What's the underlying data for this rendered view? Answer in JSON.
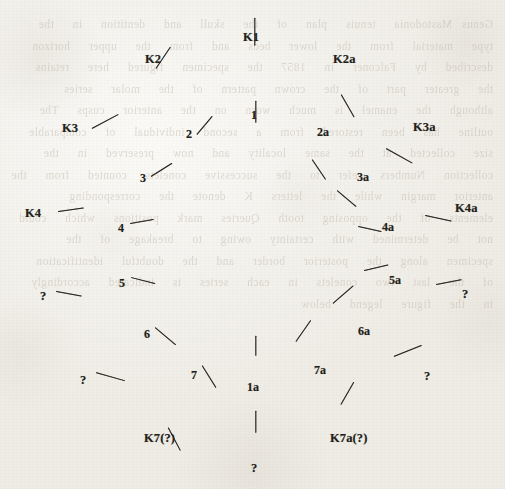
{
  "figure": {
    "kind": "scanned-diagram",
    "ink_color": "#2b2621",
    "paper_color": "#f3f1ec",
    "bleed_text": "Genus Mastodonia  tenuis  plan  of  the  skull  and  dentition  in  the  type  material  from  the  lower  beds  and  from  the  upper  horizon  described  by  Falconer  in  1857  the  specimen  figured  here  retains  the  greater  part  of  the  crown  pattern  of  the  molar  series  although  the  enamel  is  much  worn  on  the  anterior  cusps  The  outline  has  been  restored  from  a  second  individual  of  comparable  size  collected  at  the  same  locality  and  now  preserved  in  the  collection  Numbers  refer  to  the  successive  conelets  counted  from  the  anterior  margin  while  the  letters  K  denote  the  corresponding  elements  of  the  opposing  tooth  Queries  mark  positions  which  could  not  be  determined  with  certainty  owing  to  breakage  of  the  specimen  along  the  posterior  border  and  the  doubtful  identification  of  the  last  two  conelets  in  each  series  is  indicated  accordingly  in  the  figure  legend  below",
    "markers": [
      {
        "id": "K1",
        "label": "K1",
        "type": "outer",
        "lx": 243,
        "ly": 31,
        "tx": 255,
        "ty": 45,
        "len": 28,
        "angle": 90
      },
      {
        "id": "K2",
        "label": "K2",
        "type": "outer",
        "lx": 145,
        "ly": 53,
        "tx": 156,
        "ty": 68,
        "len": 26,
        "angle": 56
      },
      {
        "id": "K2a",
        "label": "K2a",
        "type": "outer",
        "lx": 333,
        "ly": 53,
        "tx": 341,
        "ty": 94,
        "len": 26,
        "angle": -60
      },
      {
        "id": "K3",
        "label": "K3",
        "type": "outer",
        "lx": 62,
        "ly": 122,
        "tx": 92,
        "ly_pad": 0,
        "ty": 128,
        "len": 30,
        "angle": 28
      },
      {
        "id": "K3a",
        "label": "K3a",
        "type": "outer",
        "lx": 413,
        "ly": 121,
        "tx": 386,
        "ty": 148,
        "len": 30,
        "angle": -29
      },
      {
        "id": "K4",
        "label": "K4",
        "type": "outer",
        "lx": 25,
        "ly": 207,
        "tx": 58,
        "ty": 211,
        "len": 26,
        "angle": 8
      },
      {
        "id": "K4a",
        "label": "K4a",
        "type": "outer",
        "lx": 455,
        "ly": 202,
        "tx": 425,
        "ty": 215,
        "len": 27,
        "angle": -12
      },
      {
        "id": "Q-L1",
        "label": "?",
        "type": "outer",
        "lx": 40,
        "ly": 290,
        "tx": 56,
        "ty": 291,
        "len": 26,
        "angle": -10
      },
      {
        "id": "Q-R1",
        "label": "?",
        "type": "outer",
        "lx": 462,
        "ly": 288,
        "tx": 436,
        "ty": 284,
        "len": 26,
        "angle": 11
      },
      {
        "id": "Q-L2",
        "label": "?",
        "type": "outer",
        "lx": 80,
        "ly": 374,
        "tx": 96,
        "ty": 372,
        "len": 30,
        "angle": -16
      },
      {
        "id": "Q-R2",
        "label": "?",
        "type": "outer",
        "lx": 424,
        "ly": 370,
        "tx": 394,
        "ty": 356,
        "len": 30,
        "angle": 22
      },
      {
        "id": "K7",
        "label": "K7(?)",
        "type": "outer",
        "lx": 144,
        "ly": 432,
        "tx": 168,
        "ty": 427,
        "len": 26,
        "angle": -62
      },
      {
        "id": "K7a",
        "label": "K7a(?)",
        "type": "outer",
        "lx": 330,
        "ly": 432,
        "tx": 341,
        "ty": 404,
        "len": 26,
        "angle": 60
      },
      {
        "id": "Q-B",
        "label": "?",
        "type": "outer",
        "lx": 251,
        "ly": 462,
        "tx": 256,
        "ty": 432,
        "len": 22,
        "angle": 90
      },
      {
        "id": "1",
        "label": "1",
        "type": "inner",
        "lx": 251,
        "ly": 109,
        "tx": 256,
        "ty": 122,
        "len": 22,
        "angle": 90
      },
      {
        "id": "2",
        "label": "2",
        "type": "inner",
        "lx": 186,
        "ly": 128,
        "tx": 197,
        "ty": 134,
        "len": 24,
        "angle": 50
      },
      {
        "id": "2a",
        "label": "2a",
        "type": "inner",
        "lx": 317,
        "ly": 126,
        "tx": 312,
        "ty": 159,
        "len": 24,
        "angle": -56
      },
      {
        "id": "3",
        "label": "3",
        "type": "inner",
        "lx": 140,
        "ly": 172,
        "tx": 151,
        "ty": 176,
        "len": 25,
        "angle": 32
      },
      {
        "id": "3a",
        "label": "3a",
        "type": "inner",
        "lx": 357,
        "ly": 171,
        "tx": 337,
        "ty": 190,
        "len": 25,
        "angle": -40
      },
      {
        "id": "4",
        "label": "4",
        "type": "inner",
        "lx": 118,
        "ly": 222,
        "tx": 130,
        "ty": 223,
        "len": 24,
        "angle": 10
      },
      {
        "id": "4a",
        "label": "4a",
        "type": "inner",
        "lx": 382,
        "ly": 221,
        "tx": 358,
        "ty": 226,
        "len": 24,
        "angle": -12
      },
      {
        "id": "5",
        "label": "5",
        "type": "inner",
        "lx": 119,
        "ly": 277,
        "tx": 131,
        "ty": 277,
        "len": 25,
        "angle": -14
      },
      {
        "id": "5a",
        "label": "5a",
        "type": "inner",
        "lx": 389,
        "ly": 274,
        "tx": 364,
        "ty": 270,
        "len": 25,
        "angle": 13
      },
      {
        "id": "6",
        "label": "6",
        "type": "inner",
        "lx": 144,
        "ly": 328,
        "tx": 155,
        "ty": 327,
        "len": 27,
        "angle": -40
      },
      {
        "id": "6a",
        "label": "6a",
        "type": "inner",
        "lx": 358,
        "ly": 325,
        "tx": 333,
        "ty": 303,
        "len": 27,
        "angle": 41
      },
      {
        "id": "7",
        "label": "7",
        "type": "inner",
        "lx": 191,
        "ly": 369,
        "tx": 202,
        "ty": 365,
        "len": 26,
        "angle": -58
      },
      {
        "id": "7a",
        "label": "7a",
        "type": "inner",
        "lx": 314,
        "ly": 364,
        "tx": 296,
        "ty": 341,
        "len": 26,
        "angle": 55
      },
      {
        "id": "1a",
        "label": "1a",
        "type": "inner",
        "lx": 247,
        "ly": 381,
        "tx": 256,
        "ty": 355,
        "len": 20,
        "angle": 90
      }
    ]
  }
}
